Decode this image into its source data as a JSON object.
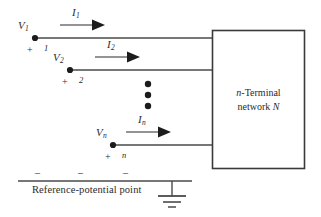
{
  "figure": {
    "type": "circuit-diagram",
    "background_color": "#ffffff",
    "line_color": "#3a3a3a",
    "text_color": "#2b2b2b"
  },
  "terminals": [
    {
      "voltage_label": "V",
      "voltage_subscript": "1",
      "current_label": "I",
      "current_subscript": "1",
      "polarity_sign": "+",
      "terminal_number": "1",
      "node_x": 35,
      "node_y": 38
    },
    {
      "voltage_label": "V",
      "voltage_subscript": "2",
      "current_label": "I",
      "current_subscript": "2",
      "polarity_sign": "+",
      "terminal_number": "2",
      "node_x": 70,
      "node_y": 70
    },
    {
      "voltage_label": "V",
      "voltage_subscript": "n",
      "current_label": "I",
      "current_subscript": "n",
      "polarity_sign": "+",
      "terminal_number": "n",
      "node_x": 113,
      "node_y": 145
    }
  ],
  "ellipsis": {
    "dot_count": 3,
    "label": "vertical-ellipsis"
  },
  "network_box": {
    "line1_prefix": "n",
    "line1_rest": "-Terminal",
    "line2_prefix": "network ",
    "line2_symbol": "N"
  },
  "reference": {
    "caption": "Reference-potential point",
    "minus_signs": [
      "–",
      "–",
      "–"
    ],
    "ground_symbol": "earth-ground"
  }
}
